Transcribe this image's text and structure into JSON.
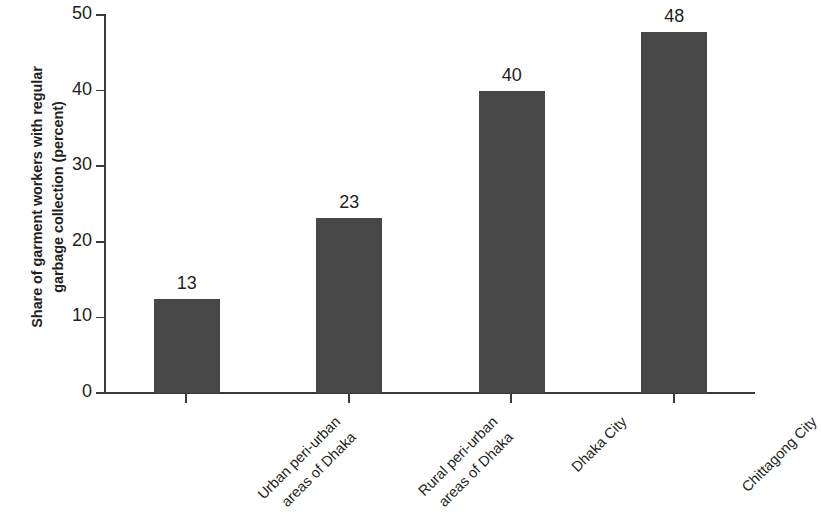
{
  "chart_data": {
    "type": "bar",
    "title": "",
    "xlabel": "",
    "ylabel": "Share of garment workers with regular garbage collection (percent)",
    "ylabel_lines": [
      "Share of garment workers with regular",
      "garbage collection (percent)"
    ],
    "categories": [
      "Urban peri-urban areas of Dhaka",
      "Rural peri-urban areas of Dhaka",
      "Dhaka City",
      "Chittagong City"
    ],
    "category_lines": [
      [
        "Urban peri-urban",
        "areas of Dhaka"
      ],
      [
        "Rural peri-urban",
        "areas of Dhaka"
      ],
      [
        "Dhaka City"
      ],
      [
        "Chittagong City"
      ]
    ],
    "values": [
      12.4,
      23.2,
      40.0,
      47.7
    ],
    "data_labels": [
      "13",
      "23",
      "40",
      "48"
    ],
    "ylim": [
      0,
      50
    ],
    "yticks": [
      0,
      10,
      20,
      30,
      40,
      50
    ],
    "ytick_labels": [
      "0",
      "10",
      "20",
      "30",
      "40",
      "50"
    ],
    "grid": false,
    "legend": false,
    "bar_color": "#474747",
    "axis_color": "#3a3a3a",
    "text_color": "#231f20",
    "background": "#ffffff"
  }
}
